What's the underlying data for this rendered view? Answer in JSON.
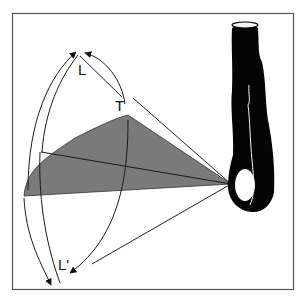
{
  "figure": {
    "labels": {
      "L": "L",
      "T": "T",
      "L_prime": "L'"
    },
    "colors": {
      "background": "#ffffff",
      "frame": "#555555",
      "plane_fill": "#7a7a7a",
      "lines": "#1a1a1a",
      "limb": "#050505",
      "limb_highlight": "#f2f2f2"
    },
    "elements": [
      "frame",
      "shaded-plane",
      "pivot-cone-lines",
      "arc-arrows-upper",
      "arc-arrows-lower",
      "limb-silhouette"
    ]
  }
}
